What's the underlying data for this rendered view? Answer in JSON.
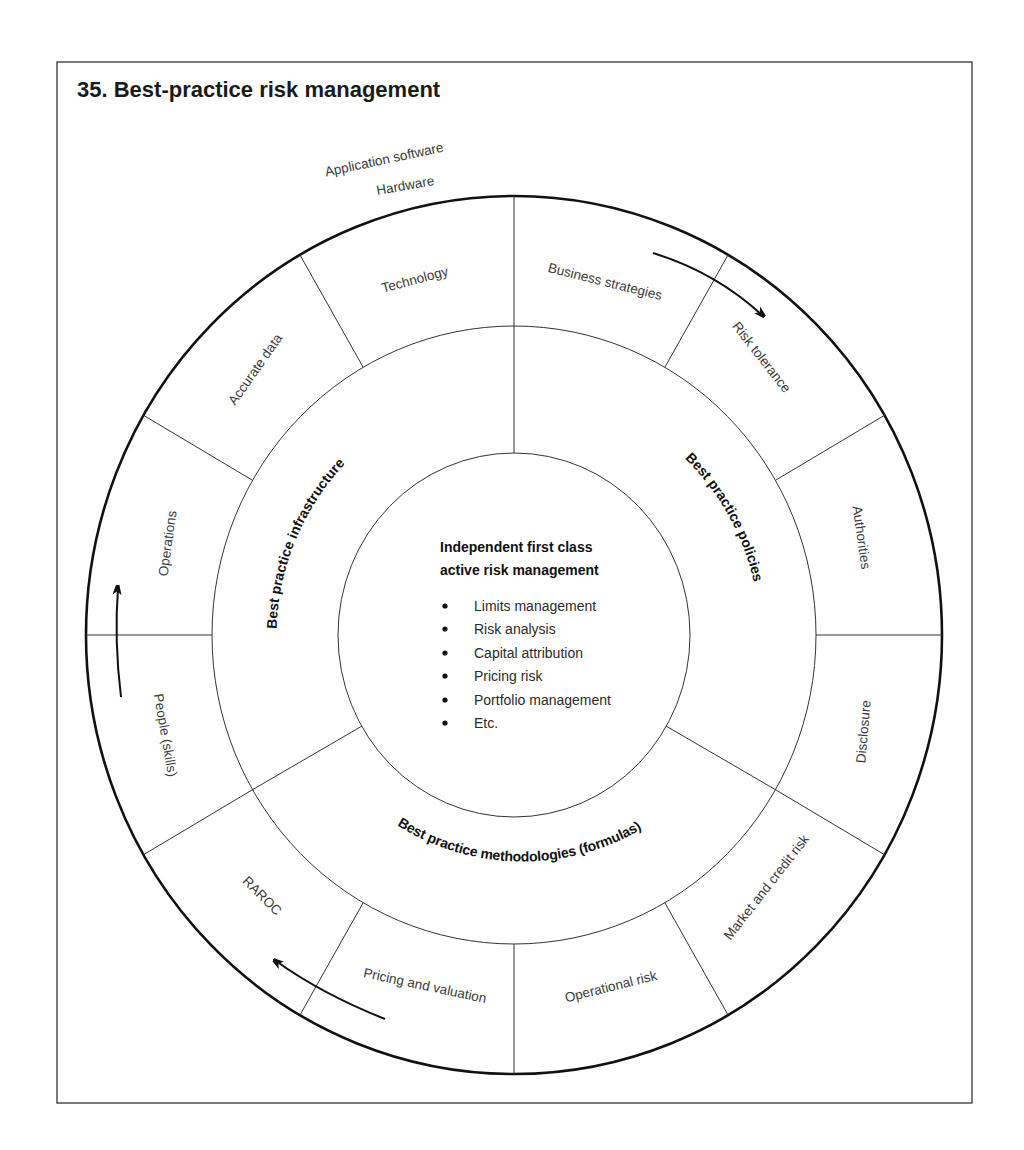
{
  "title": "35. Best-practice risk management",
  "annotation": {
    "line1": "Application software",
    "line2": "Hardware"
  },
  "core": {
    "heading_line1": "Independent first class",
    "heading_line2": "active risk management",
    "items": [
      "Limits management",
      "Risk analysis",
      "Capital attribution",
      "Pricing risk",
      "Portfolio management",
      "Etc."
    ]
  },
  "middle_ring": {
    "infrastructure": "Best practice infrastructure",
    "policies": "Best practice policies",
    "methodologies": "Best practice methodologies (formulas)"
  },
  "outer_ring": {
    "segments": [
      "Technology",
      "Business strategies",
      "Risk tolerance",
      "Authorities",
      "Disclosure",
      "Market and credit risk",
      "Operational risk",
      "Pricing and valuation",
      "RAROC",
      "People (skills)",
      "Operations",
      "Accurate data"
    ]
  },
  "colors": {
    "line": "#333333",
    "outer_line": "#111111",
    "text": "#3a3a3a"
  }
}
